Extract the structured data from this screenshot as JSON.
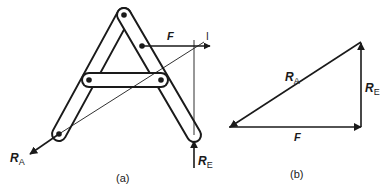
{
  "figure_a": {
    "caption": "(a)",
    "labels": {
      "force": "F",
      "reaction_a": "R",
      "reaction_a_sub": "A",
      "reaction_e": "R",
      "reaction_e_sub": "E",
      "intersection_mark": "I"
    }
  },
  "figure_b": {
    "caption": "(b)",
    "labels": {
      "force": "F",
      "reaction_a": "R",
      "reaction_a_sub": "A",
      "reaction_e": "R",
      "reaction_e_sub": "E"
    }
  },
  "colors": {
    "ink": "#1a1a1a",
    "background": "#ffffff"
  }
}
